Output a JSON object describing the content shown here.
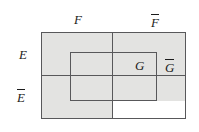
{
  "figure": {
    "type": "set-region-diagram",
    "width": 199,
    "height": 132,
    "background_color": "#ffffff",
    "shade_color": "#e3e3e1",
    "stroke_color": "#58585a",
    "text_color": "#1b1b1b"
  },
  "labels": {
    "f": "F",
    "f_bar": "F",
    "e": "E",
    "e_bar": "E",
    "g": "G",
    "g_bar": "G"
  },
  "regions": {
    "outer_rect": {
      "x": 41,
      "y": 32,
      "width": 145,
      "height": 87
    },
    "inner_g_rect": {
      "x": 70,
      "y": 52,
      "width": 87,
      "height": 49
    },
    "vertical_divider_x": 112,
    "horizontal_divider_y": 75,
    "shaded_description": "All of E (top band) and the F column of E-bar and G within E-bar are shaded; the E-bar and F-bar region outside G is unshaded.",
    "unshaded_cell": {
      "x": 112,
      "y": 101,
      "width": 74,
      "height": 18
    }
  }
}
